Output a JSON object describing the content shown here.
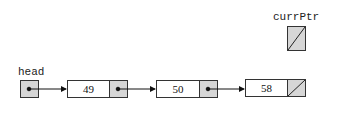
{
  "labels": {
    "head": "head",
    "curr_ptr": "currPtr"
  },
  "nodes": [
    {
      "value": "49",
      "next": "node-2"
    },
    {
      "value": "50",
      "next": "node-3"
    },
    {
      "value": "58",
      "next": "null"
    }
  ],
  "curr_ptr": {
    "value": "null"
  },
  "colors": {
    "pointer_fill": "#d6d6d6",
    "border": "#333333"
  }
}
